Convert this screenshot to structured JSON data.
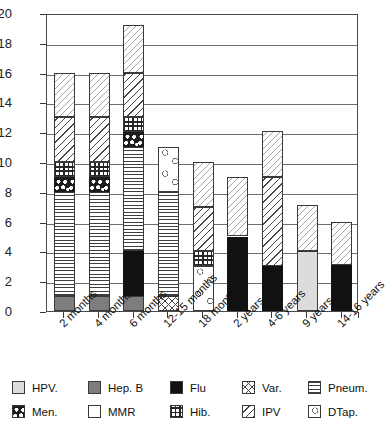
{
  "chart_data": {
    "type": "bar",
    "title": "",
    "subtitle": "",
    "xlabel": "",
    "ylabel": "",
    "stacked": true,
    "grid": true,
    "legend_position": "bottom",
    "ylim": [
      0,
      20
    ],
    "ytick_step": 2,
    "yticks": [
      "20",
      "18",
      "16",
      "14",
      "12",
      "10",
      "8",
      "6",
      "4",
      "2",
      "0"
    ],
    "categories": [
      "2 months",
      "4 months",
      "6 months",
      "12-15 months",
      "18 months",
      "2 years",
      "4-6 years",
      "9 years",
      "14-16 years"
    ],
    "series": [
      {
        "name": "HPV.",
        "key": "hpv",
        "pattern": "light-gray-solid",
        "values": [
          0,
          0,
          0,
          0,
          0,
          0,
          0,
          4,
          0
        ]
      },
      {
        "name": "Hep. B",
        "key": "hepb",
        "pattern": "medium-gray-solid",
        "values": [
          1,
          1,
          1,
          0,
          0,
          0,
          0,
          0,
          0
        ]
      },
      {
        "name": "Flu",
        "key": "flu",
        "pattern": "black-solid",
        "values": [
          0,
          0,
          3,
          0,
          0,
          5,
          3,
          0,
          3.1
        ]
      },
      {
        "name": "Var.",
        "key": "var",
        "pattern": "cross-hatch",
        "values": [
          0,
          0,
          0,
          1,
          0,
          0,
          0,
          0,
          0
        ]
      },
      {
        "name": "Pneum.",
        "key": "pneum",
        "pattern": "horizontal-lines",
        "values": [
          7,
          7,
          7,
          7,
          0,
          0,
          0,
          0,
          0
        ]
      },
      {
        "name": "Men.",
        "key": "men",
        "pattern": "black-white-dots",
        "values": [
          1,
          1,
          1,
          0,
          0,
          0,
          0,
          0,
          0
        ]
      },
      {
        "name": "MMR",
        "key": "mmr",
        "pattern": "white-blank",
        "values": [
          0,
          0,
          0,
          0,
          0,
          0,
          0,
          0,
          0
        ]
      },
      {
        "name": "Hib.",
        "key": "hib",
        "pattern": "grid-squares",
        "values": [
          1,
          1,
          1,
          0,
          1,
          0,
          0,
          0,
          0
        ]
      },
      {
        "name": "IPV",
        "key": "ipv",
        "pattern": "diagonal-lines",
        "values": [
          3,
          3,
          3,
          0,
          3,
          0,
          6,
          0,
          0
        ]
      },
      {
        "name": "DTap.",
        "key": "dtap",
        "pattern": "light-diagonal",
        "values": [
          3,
          3,
          3.2,
          0,
          3,
          4,
          3.1,
          3.1,
          2.9
        ]
      },
      {
        "name": "DTap. (circles)",
        "key": "dtapc",
        "pattern": "open-circles",
        "values": [
          0,
          0,
          0,
          3,
          3,
          0,
          0,
          0,
          0
        ]
      }
    ],
    "bar_totals": [
      16,
      16,
      19.2,
      11,
      10,
      9,
      12.1,
      7.1,
      6
    ],
    "stacks": [
      {
        "category": "2 months",
        "segments": [
          {
            "key": "hepb",
            "from": 0,
            "to": 1
          },
          {
            "key": "pneum",
            "from": 1,
            "to": 8
          },
          {
            "key": "men",
            "from": 8,
            "to": 9
          },
          {
            "key": "hib",
            "from": 9,
            "to": 10
          },
          {
            "key": "ipv",
            "from": 10,
            "to": 13
          },
          {
            "key": "dtap",
            "from": 13,
            "to": 16
          }
        ]
      },
      {
        "category": "4 months",
        "segments": [
          {
            "key": "hepb",
            "from": 0,
            "to": 1
          },
          {
            "key": "pneum",
            "from": 1,
            "to": 8
          },
          {
            "key": "men",
            "from": 8,
            "to": 9
          },
          {
            "key": "hib",
            "from": 9,
            "to": 10
          },
          {
            "key": "ipv",
            "from": 10,
            "to": 13
          },
          {
            "key": "dtap",
            "from": 13,
            "to": 16
          }
        ]
      },
      {
        "category": "6 months",
        "segments": [
          {
            "key": "hepb",
            "from": 0,
            "to": 1
          },
          {
            "key": "flu",
            "from": 1,
            "to": 4
          },
          {
            "key": "pneum",
            "from": 4,
            "to": 11
          },
          {
            "key": "men",
            "from": 11,
            "to": 12
          },
          {
            "key": "hib",
            "from": 12,
            "to": 13
          },
          {
            "key": "ipv",
            "from": 13,
            "to": 16
          },
          {
            "key": "dtap",
            "from": 16,
            "to": 19.2
          }
        ]
      },
      {
        "category": "12-15 months",
        "segments": [
          {
            "key": "var",
            "from": 0,
            "to": 1
          },
          {
            "key": "pneum",
            "from": 1,
            "to": 8
          },
          {
            "key": "dtapc",
            "from": 8,
            "to": 11
          }
        ]
      },
      {
        "category": "18 months",
        "segments": [
          {
            "key": "dtapc",
            "from": 0,
            "to": 3
          },
          {
            "key": "hib",
            "from": 3,
            "to": 4
          },
          {
            "key": "ipv",
            "from": 4,
            "to": 7
          },
          {
            "key": "dtap",
            "from": 7,
            "to": 10
          }
        ]
      },
      {
        "category": "2 years",
        "segments": [
          {
            "key": "flu",
            "from": 0,
            "to": 5
          },
          {
            "key": "dtap",
            "from": 5,
            "to": 9
          }
        ]
      },
      {
        "category": "4-6 years",
        "segments": [
          {
            "key": "flu",
            "from": 0,
            "to": 3
          },
          {
            "key": "ipv",
            "from": 3,
            "to": 9
          },
          {
            "key": "dtap",
            "from": 9,
            "to": 12.1
          }
        ]
      },
      {
        "category": "9 years",
        "segments": [
          {
            "key": "hpv",
            "from": 0,
            "to": 4
          },
          {
            "key": "dtap",
            "from": 4,
            "to": 7.1
          }
        ]
      },
      {
        "category": "14-16 years",
        "segments": [
          {
            "key": "flu",
            "from": 0,
            "to": 3.1
          },
          {
            "key": "dtap",
            "from": 3.1,
            "to": 6
          }
        ]
      }
    ],
    "legend": [
      {
        "name": "HPV.",
        "key": "hpv"
      },
      {
        "name": "Hep. B",
        "key": "hepb"
      },
      {
        "name": "Flu",
        "key": "flu"
      },
      {
        "name": "Var.",
        "key": "var"
      },
      {
        "name": "Pneum.",
        "key": "pneum"
      },
      {
        "name": "Men.",
        "key": "men"
      },
      {
        "name": "MMR",
        "key": "mmr"
      },
      {
        "name": "Hib.",
        "key": "hib"
      },
      {
        "name": "IPV",
        "key": "ipv"
      },
      {
        "name": "DTap.",
        "key": "dtap"
      }
    ]
  }
}
